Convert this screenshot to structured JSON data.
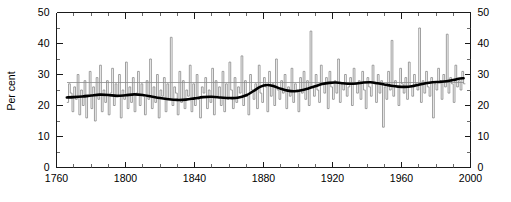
{
  "chart_data": {
    "type": "line",
    "title": "",
    "subtitle": "",
    "xlabel": "",
    "ylabel": "Per cent",
    "xlim": [
      1760,
      2000
    ],
    "ylim": [
      0,
      50
    ],
    "grid": false,
    "legend_position": "none",
    "x_ticks_major": [
      1760,
      1800,
      1840,
      1880,
      1920,
      1960,
      2000
    ],
    "x_tick_labels": [
      "1760",
      "1800",
      "1840",
      "1880",
      "1920",
      "1960",
      "2000"
    ],
    "x_tick_minor_step": 10,
    "y_ticks_major": [
      0,
      10,
      20,
      30,
      40,
      50
    ],
    "y_tick_labels": [
      "0",
      "10",
      "20",
      "30",
      "40",
      "50"
    ],
    "y_tick_minor_step": 5,
    "y_axis_right_mirrored": true,
    "series": [
      {
        "name": "Annual value",
        "style": "step",
        "color": "#8c8c8c",
        "x_start": 1766,
        "x_end": 1996,
        "x_step": 1,
        "values": [
          21,
          27,
          24,
          18,
          26,
          22,
          30,
          17,
          25,
          20,
          28,
          16,
          23,
          31,
          19,
          26,
          15,
          29,
          22,
          33,
          18,
          25,
          21,
          28,
          17,
          24,
          32,
          20,
          27,
          23,
          30,
          16,
          25,
          22,
          34,
          19,
          26,
          21,
          29,
          18,
          24,
          31,
          20,
          27,
          23,
          17,
          28,
          22,
          35,
          19,
          26,
          21,
          30,
          16,
          25,
          23,
          29,
          18,
          27,
          22,
          42,
          20,
          26,
          24,
          17,
          31,
          21,
          28,
          19,
          25,
          23,
          33,
          18,
          27,
          20,
          30,
          22,
          16,
          26,
          24,
          29,
          19,
          25,
          21,
          32,
          17,
          28,
          23,
          26,
          20,
          31,
          18,
          27,
          22,
          34,
          25,
          19,
          29,
          21,
          26,
          24,
          36,
          20,
          28,
          23,
          17,
          30,
          25,
          22,
          27,
          19,
          33,
          24,
          21,
          29,
          26,
          18,
          31,
          23,
          27,
          20,
          35,
          25,
          22,
          28,
          24,
          30,
          19,
          26,
          23,
          32,
          21,
          27,
          25,
          18,
          29,
          24,
          31,
          22,
          28,
          20,
          44,
          26,
          23,
          30,
          25,
          21,
          33,
          27,
          24,
          29,
          19,
          31,
          26,
          22,
          28,
          24,
          35,
          21,
          27,
          25,
          30,
          23,
          26,
          29,
          20,
          32,
          27,
          24,
          28,
          22,
          31,
          25,
          19,
          29,
          26,
          23,
          33,
          27,
          21,
          30,
          24,
          28,
          13,
          26,
          22,
          31,
          25,
          41,
          23,
          28,
          26,
          20,
          32,
          27,
          24,
          29,
          22,
          34,
          26,
          23,
          30,
          27,
          25,
          45,
          21,
          28,
          24,
          31,
          26,
          23,
          29,
          16,
          27,
          25,
          32,
          28,
          22,
          30,
          26,
          43,
          24,
          29,
          27,
          21,
          33,
          26,
          28,
          25,
          31,
          27
        ]
      },
      {
        "name": "Mean reference",
        "style": "horizontal-line",
        "color": "#8c8c8c",
        "value": 27.3,
        "x_start": 1766,
        "x_end": 1996
      },
      {
        "name": "Smoothed trend",
        "style": "smooth",
        "color": "#000000",
        "x_start": 1766,
        "x_end": 1996,
        "points": [
          [
            1766,
            22.6
          ],
          [
            1770,
            22.7
          ],
          [
            1775,
            22.9
          ],
          [
            1780,
            23.2
          ],
          [
            1785,
            23.5
          ],
          [
            1790,
            23.4
          ],
          [
            1795,
            23.1
          ],
          [
            1800,
            23.3
          ],
          [
            1805,
            23.6
          ],
          [
            1810,
            23.4
          ],
          [
            1815,
            22.9
          ],
          [
            1820,
            22.4
          ],
          [
            1825,
            22.0
          ],
          [
            1830,
            21.8
          ],
          [
            1835,
            21.9
          ],
          [
            1840,
            22.3
          ],
          [
            1845,
            22.7
          ],
          [
            1850,
            22.8
          ],
          [
            1855,
            22.6
          ],
          [
            1860,
            22.4
          ],
          [
            1865,
            22.5
          ],
          [
            1870,
            23.3
          ],
          [
            1874,
            24.6
          ],
          [
            1878,
            26.0
          ],
          [
            1882,
            26.6
          ],
          [
            1886,
            26.2
          ],
          [
            1890,
            25.4
          ],
          [
            1894,
            24.8
          ],
          [
            1898,
            24.6
          ],
          [
            1902,
            24.9
          ],
          [
            1906,
            25.5
          ],
          [
            1910,
            26.2
          ],
          [
            1914,
            26.9
          ],
          [
            1918,
            27.3
          ],
          [
            1922,
            27.4
          ],
          [
            1926,
            27.2
          ],
          [
            1930,
            27.0
          ],
          [
            1934,
            27.1
          ],
          [
            1938,
            27.4
          ],
          [
            1942,
            27.5
          ],
          [
            1946,
            27.2
          ],
          [
            1950,
            26.8
          ],
          [
            1954,
            26.4
          ],
          [
            1958,
            26.1
          ],
          [
            1962,
            26.0
          ],
          [
            1966,
            26.2
          ],
          [
            1970,
            26.7
          ],
          [
            1974,
            27.2
          ],
          [
            1978,
            27.5
          ],
          [
            1982,
            27.6
          ],
          [
            1986,
            27.8
          ],
          [
            1990,
            28.2
          ],
          [
            1993,
            28.6
          ],
          [
            1996,
            28.8
          ]
        ]
      }
    ]
  },
  "axes": {
    "y_left_label": "Per cent",
    "y_left_ticks": [
      "50",
      "40",
      "30",
      "20",
      "10",
      "0"
    ],
    "y_right_ticks": [
      "50",
      "40",
      "30",
      "20",
      "10",
      "0"
    ],
    "x_ticks": [
      "1760",
      "1800",
      "1840",
      "1880",
      "1920",
      "1960",
      "2000"
    ]
  },
  "colors": {
    "axis": "#1a1a1a",
    "annual_series": "#8c8c8c",
    "mean_line": "#8c8c8c",
    "smooth_line": "#000000",
    "background": "#ffffff"
  }
}
